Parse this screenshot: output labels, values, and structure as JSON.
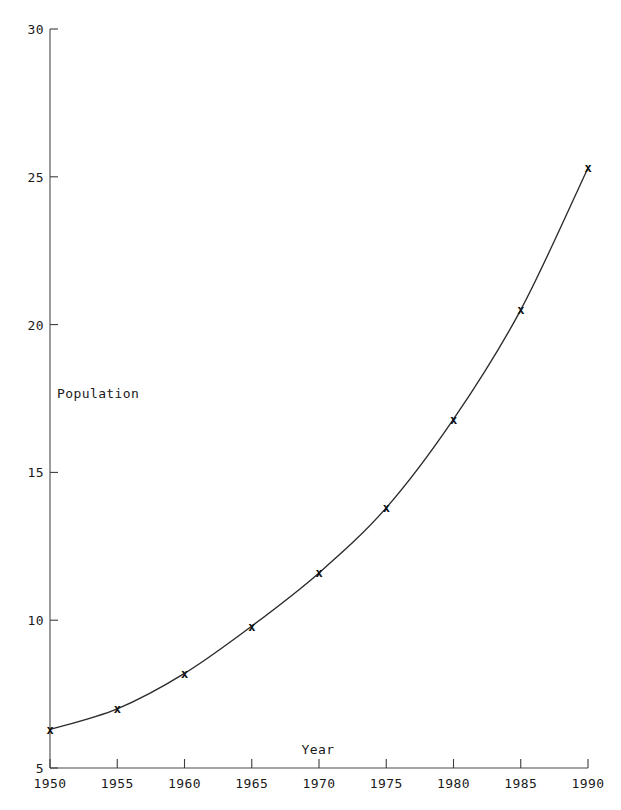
{
  "chart_data": {
    "type": "line",
    "title": "",
    "xlabel": "Year",
    "ylabel": "Population",
    "x": [
      1950,
      1955,
      1960,
      1965,
      1970,
      1975,
      1980,
      1985,
      1990
    ],
    "values": [
      6.3,
      7.0,
      8.2,
      9.8,
      11.6,
      13.8,
      16.8,
      20.5,
      25.3
    ],
    "series": [
      {
        "name": "Population",
        "values": [
          6.3,
          7.0,
          8.2,
          9.8,
          11.6,
          13.8,
          16.8,
          20.5,
          25.3
        ]
      }
    ],
    "xlim": [
      1950,
      1990
    ],
    "ylim": [
      5,
      30
    ],
    "xticks": [
      "1950",
      "1955",
      "1960",
      "1965",
      "1970",
      "1975",
      "1980",
      "1985",
      "1990"
    ],
    "yticks": [
      "5",
      "10",
      "15",
      "20",
      "25",
      "30"
    ],
    "marker": "x",
    "grid": false,
    "legend": false,
    "legend_position": "none",
    "line_color": "#2b2b2b",
    "marker_color": "#111111",
    "axis_color": "#4a4a4a",
    "background_color": "#ffffff"
  },
  "axis": {
    "y_title": "Population",
    "x_title": "Year"
  }
}
